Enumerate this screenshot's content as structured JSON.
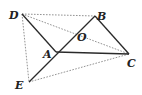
{
  "figure": {
    "type": "geometry",
    "points": {
      "D": {
        "label": "D",
        "x": 22,
        "y": 14,
        "lx": 9,
        "ly": 19
      },
      "B": {
        "label": "B",
        "x": 95,
        "y": 16,
        "lx": 97,
        "ly": 20
      },
      "O": {
        "label": "O",
        "x": 76,
        "y": 33,
        "lx": 77,
        "ly": 41
      },
      "A": {
        "label": "A",
        "x": 56,
        "y": 52,
        "lx": 43,
        "ly": 58
      },
      "C": {
        "label": "C",
        "x": 129,
        "y": 54,
        "lx": 127,
        "ly": 67
      },
      "E": {
        "label": "E",
        "x": 29,
        "y": 82,
        "lx": 15,
        "ly": 89
      }
    },
    "solid_segments": [
      [
        "D",
        "A"
      ],
      [
        "E",
        "B"
      ],
      [
        "B",
        "C"
      ],
      [
        "A",
        "C"
      ]
    ],
    "dashed_segments": [
      [
        "D",
        "B"
      ],
      [
        "D",
        "C"
      ],
      [
        "D",
        "E"
      ],
      [
        "E",
        "C"
      ]
    ],
    "colors": {
      "solid": "#2a2a2a",
      "dashed": "#777777",
      "label": "#222222"
    }
  }
}
